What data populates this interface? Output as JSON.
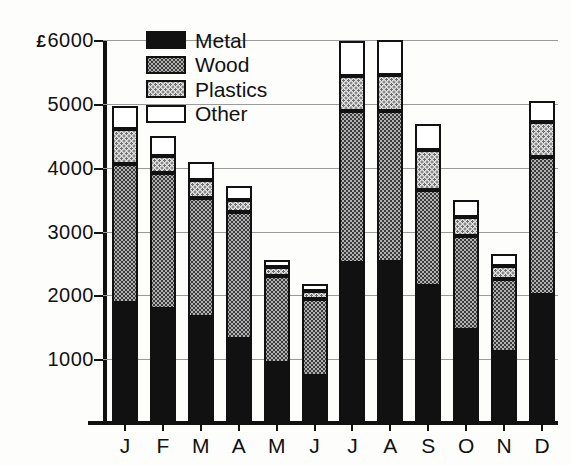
{
  "chart_data": {
    "type": "bar",
    "subtype": "stacked-bar",
    "title": "",
    "xlabel": "",
    "ylabel": "",
    "currency_symbol": "£",
    "ylim": [
      0,
      6000
    ],
    "ytick_values": [
      1000,
      2000,
      3000,
      4000,
      5000,
      6000
    ],
    "ytick_labels": [
      "1000",
      "2000",
      "3000",
      "4000",
      "5000",
      "£6000"
    ],
    "grid": true,
    "grid_axis": "y",
    "legend_position": "top-center",
    "categories": [
      "J",
      "F",
      "M",
      "A",
      "M",
      "J",
      "J",
      "A",
      "S",
      "O",
      "N",
      "D"
    ],
    "category_names": [
      "January",
      "February",
      "March",
      "April",
      "May",
      "June",
      "July",
      "August",
      "September",
      "October",
      "November",
      "December"
    ],
    "series": [
      {
        "name": "Metal",
        "color": "#111111",
        "pattern": "solid-black",
        "values": [
          1880,
          1790,
          1660,
          1320,
          940,
          740,
          2510,
          2520,
          2140,
          1450,
          1120,
          2000
        ]
      },
      {
        "name": "Wood",
        "color": "#b2b2b2",
        "pattern": "dark-stipple",
        "values": [
          2170,
          2120,
          1860,
          1980,
          1360,
          1210,
          2370,
          2370,
          1510,
          1480,
          1130,
          2160
        ]
      },
      {
        "name": "Plastics",
        "color": "#e2e2e2",
        "pattern": "light-stipple",
        "values": [
          550,
          280,
          290,
          200,
          150,
          120,
          560,
          560,
          620,
          290,
          210,
          560
        ]
      },
      {
        "name": "Other",
        "color": "#ffffff",
        "pattern": "white",
        "values": [
          360,
          310,
          280,
          220,
          110,
          110,
          550,
          550,
          410,
          280,
          190,
          330
        ]
      }
    ],
    "totals": [
      4960,
      4500,
      4090,
      3720,
      2560,
      2180,
      5990,
      6000,
      4680,
      3500,
      2650,
      5050
    ]
  },
  "legend": {
    "items": [
      {
        "label": "Metal"
      },
      {
        "label": "Wood"
      },
      {
        "label": "Plastics"
      },
      {
        "label": "Other"
      }
    ]
  }
}
